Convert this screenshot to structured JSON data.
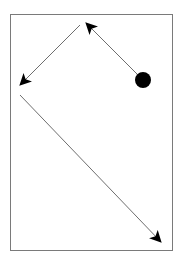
{
  "diagram": {
    "frame": {
      "x": 10,
      "y": 14,
      "width": 162,
      "height": 236,
      "stroke": "#7a7a7a"
    },
    "start_point": {
      "cx": 143,
      "cy": 80,
      "r": 8,
      "fill": "#000000"
    },
    "arrows": [
      {
        "id": "arrow-1",
        "x1": 137,
        "y1": 74,
        "x2": 86,
        "y2": 23
      },
      {
        "id": "arrow-2",
        "x1": 80,
        "y1": 25,
        "x2": 20,
        "y2": 85
      },
      {
        "id": "arrow-3",
        "x1": 20,
        "y1": 95,
        "x2": 161,
        "y2": 242
      }
    ],
    "line_color": "#6e6e6e",
    "arrowhead_color": "#000000"
  }
}
